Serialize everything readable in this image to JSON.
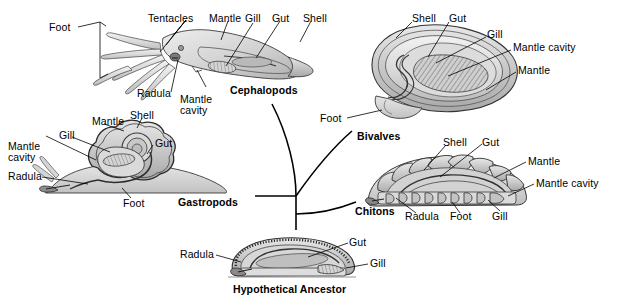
{
  "figure": {
    "background_color": "#ffffff",
    "ink_color": "#000000"
  },
  "groups": [
    {
      "id": "cephalopods",
      "name": "Cephalopods",
      "labels": [
        "Foot",
        "Tentacles",
        "Mantle",
        "Gill",
        "Gut",
        "Shell",
        "Radula",
        "Mantle\ncavity"
      ]
    },
    {
      "id": "bivalves",
      "name": "Bivalves",
      "labels": [
        "Shell",
        "Gut",
        "Gill",
        "Mantle cavity",
        "Mantle",
        "Foot"
      ]
    },
    {
      "id": "gastropods",
      "name": "Gastropods",
      "labels": [
        "Mantle",
        "Shell",
        "Gill",
        "Gut",
        "Mantle\ncavity",
        "Radula",
        "Foot"
      ]
    },
    {
      "id": "chitons",
      "name": "Chitons",
      "labels": [
        "Shell",
        "Gut",
        "Mantle",
        "Mantle cavity",
        "Radula",
        "Foot",
        "Gill"
      ]
    },
    {
      "id": "ancestor",
      "name": "Hypothetical Ancestor",
      "labels": [
        "Radula",
        "Gut",
        "Gill"
      ]
    }
  ],
  "cephalopods": {
    "taxon": "Cephalopods",
    "foot": "Foot",
    "tentacles": "Tentacles",
    "mantle": "Mantle",
    "gill": "Gill",
    "gut": "Gut",
    "shell": "Shell",
    "radula": "Radula",
    "mantle_cavity_line1": "Mantle",
    "mantle_cavity_line2": "cavity"
  },
  "bivalves": {
    "taxon": "Bivalves",
    "shell": "Shell",
    "gut": "Gut",
    "gill": "Gill",
    "mantle_cavity": "Mantle cavity",
    "mantle": "Mantle",
    "foot": "Foot"
  },
  "gastropods": {
    "taxon": "Gastropods",
    "mantle": "Mantle",
    "shell": "Shell",
    "gill": "Gill",
    "gut": "Gut",
    "mantle_cavity_line1": "Mantle",
    "mantle_cavity_line2": "cavity",
    "radula": "Radula",
    "foot": "Foot"
  },
  "chitons": {
    "taxon": "Chitons",
    "shell": "Shell",
    "gut": "Gut",
    "mantle": "Mantle",
    "mantle_cavity": "Mantle cavity",
    "radula": "Radula",
    "foot": "Foot",
    "gill": "Gill"
  },
  "ancestor": {
    "taxon": "Hypothetical Ancestor",
    "radula": "Radula",
    "gut": "Gut",
    "gill": "Gill"
  }
}
